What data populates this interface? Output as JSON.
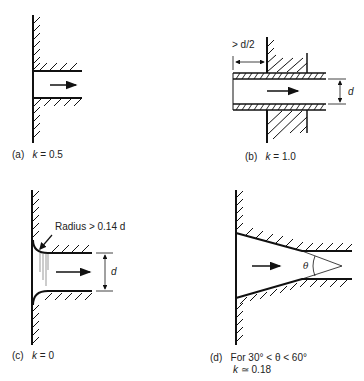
{
  "figure": {
    "panels": [
      {
        "id": "a",
        "tag": "(a)",
        "k_label": "k",
        "k_value": "= 0.5",
        "description": "Sharp-edged flush inlet"
      },
      {
        "id": "b",
        "tag": "(b)",
        "k_label": "k",
        "k_value": "= 1.0",
        "description": "Re-entrant (projecting) inlet",
        "dimension_projection": "> d/2",
        "dimension_diameter": "d"
      },
      {
        "id": "c",
        "tag": "(c)",
        "k_label": "k",
        "k_value": "= 0",
        "description": "Rounded (bell-mouth) inlet",
        "radius_note": "Radius > 0.14 d",
        "dimension_diameter": "d"
      },
      {
        "id": "d",
        "tag": "(d)",
        "line1": "For 30° < θ < 60°",
        "k_label": "k",
        "k_value": "≃ 0.18",
        "description": "Conical (chamfered) inlet",
        "angle_symbol": "θ"
      }
    ]
  }
}
